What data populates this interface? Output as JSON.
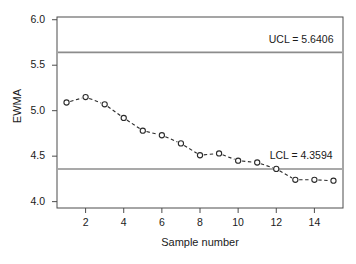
{
  "chart_data": {
    "type": "line",
    "title": "",
    "xlabel": "Sample number",
    "ylabel": "EWMA",
    "x": [
      1,
      2,
      3,
      4,
      5,
      6,
      7,
      8,
      9,
      10,
      11,
      12,
      13,
      14,
      15
    ],
    "values": [
      5.09,
      5.15,
      5.07,
      4.92,
      4.78,
      4.73,
      4.64,
      4.51,
      4.53,
      4.45,
      4.43,
      4.36,
      4.24,
      4.24,
      4.23
    ],
    "series": [
      {
        "name": "EWMA",
        "values": [
          5.09,
          5.15,
          5.07,
          4.92,
          4.78,
          4.73,
          4.64,
          4.51,
          4.53,
          4.45,
          4.43,
          4.36,
          4.24,
          4.24,
          4.23
        ],
        "marker": "open-circle",
        "linestyle": "dashed",
        "color": "#2b2b2b"
      }
    ],
    "xlim": [
      0.5,
      15.5
    ],
    "ylim": [
      3.93,
      6.03
    ],
    "xticks": [
      2,
      4,
      6,
      8,
      10,
      12,
      14
    ],
    "xtick_labels": [
      "2",
      "4",
      "6",
      "8",
      "10",
      "12",
      "14"
    ],
    "yticks": [
      4.0,
      4.5,
      5.0,
      5.5,
      6.0
    ],
    "ytick_labels": [
      "4.0",
      "4.5",
      "5.0",
      "5.5",
      "6.0"
    ],
    "grid": false,
    "legend": null,
    "control_limits": [
      {
        "name": "UCL",
        "value": 5.6406,
        "label": "UCL = 5.6406",
        "color": "#8c8c8c"
      },
      {
        "name": "LCL",
        "value": 4.3594,
        "label": "LCL = 4.3594",
        "color": "#8c8c8c"
      }
    ],
    "annotations": [
      {
        "text": "UCL = 5.6406",
        "x": 13.2,
        "y": 5.78
      },
      {
        "text": "LCL = 4.3594",
        "x": 13.2,
        "y": 4.5
      }
    ],
    "colors": {
      "axis": "#4d4d4d",
      "frame": "#4d4d4d",
      "series": "#2b2b2b",
      "limit_line": "#8c8c8c",
      "background": "#ffffff",
      "text": "#1a1a1a"
    }
  }
}
